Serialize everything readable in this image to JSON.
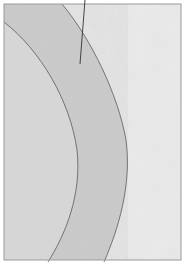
{
  "diagram": {
    "type": "cross-section illustration",
    "regions": [
      {
        "name": "inner-core",
        "fill": "#d4d4d4"
      },
      {
        "name": "middle-layer",
        "fill": "#c6c6c6"
      },
      {
        "name": "outer-mottled",
        "fill": "#d9d9d9"
      }
    ],
    "colors": {
      "frame": "#9a9a9a",
      "boundary": "#5a5a5a",
      "leader": "#333333",
      "background": "#ffffff"
    },
    "labels": []
  }
}
